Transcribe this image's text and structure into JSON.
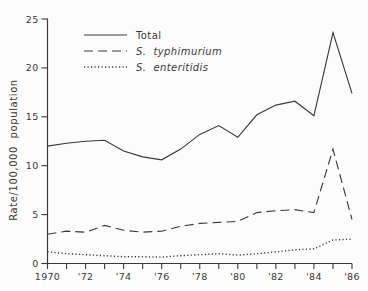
{
  "figure": {
    "background": "#fcfcfc",
    "line_color": "#3a3a3a"
  },
  "chart_data": {
    "type": "line",
    "ylabel": "Rate/100,000  population",
    "xlabel": "",
    "ylim": [
      0,
      25
    ],
    "xlim": [
      1970,
      1986
    ],
    "grid": false,
    "legend_position": "top-left-inside",
    "yticks": [
      {
        "value": 0,
        "label": "0"
      },
      {
        "value": 5,
        "label": "5"
      },
      {
        "value": 10,
        "label": "10"
      },
      {
        "value": 15,
        "label": "15"
      },
      {
        "value": 20,
        "label": "20"
      },
      {
        "value": 25,
        "label": "25"
      }
    ],
    "xticks": [
      {
        "year": 1970,
        "label": "1970"
      },
      {
        "year": 1972,
        "label": "'72"
      },
      {
        "year": 1974,
        "label": "'74"
      },
      {
        "year": 1976,
        "label": "'76"
      },
      {
        "year": 1978,
        "label": "'78"
      },
      {
        "year": 1980,
        "label": "'80"
      },
      {
        "year": 1982,
        "label": "'82"
      },
      {
        "year": 1984,
        "label": "'84"
      },
      {
        "year": 1986,
        "label": "'86"
      }
    ],
    "x": [
      1970,
      1971,
      1972,
      1973,
      1974,
      1975,
      1976,
      1977,
      1978,
      1979,
      1980,
      1981,
      1982,
      1983,
      1984,
      1985,
      1986
    ],
    "series": [
      {
        "name": "Total",
        "style": "solid",
        "values": [
          12.0,
          12.3,
          12.5,
          12.6,
          11.5,
          10.9,
          10.6,
          11.7,
          13.2,
          14.1,
          12.9,
          15.2,
          16.2,
          16.6,
          15.1,
          23.6,
          17.4
        ]
      },
      {
        "name": "S.  typhimurium",
        "style": "dashed",
        "values": [
          3.0,
          3.3,
          3.2,
          3.9,
          3.4,
          3.2,
          3.3,
          3.8,
          4.1,
          4.2,
          4.3,
          5.2,
          5.4,
          5.5,
          5.2,
          11.7,
          4.5
        ]
      },
      {
        "name": "S.  enteritidis",
        "style": "dotted",
        "values": [
          1.2,
          1.0,
          0.9,
          0.8,
          0.7,
          0.7,
          0.65,
          0.8,
          0.9,
          1.0,
          0.85,
          1.0,
          1.2,
          1.4,
          1.5,
          2.4,
          2.5
        ]
      }
    ]
  }
}
